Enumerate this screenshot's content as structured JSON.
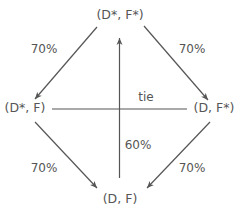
{
  "diagram": {
    "type": "state-transition",
    "colors": {
      "line": "#555555",
      "text": "#555555",
      "background": "#ffffff"
    },
    "nodes": {
      "top": {
        "label": "(D*, F*)"
      },
      "left": {
        "label": "(D*, F)"
      },
      "right": {
        "label": "(D, F*)"
      },
      "bottom": {
        "label": "(D, F)"
      }
    },
    "edges": {
      "top_to_left": {
        "from": "(D*, F*)",
        "to": "(D*, F)",
        "label": "70%",
        "directed": true
      },
      "top_to_right": {
        "from": "(D*, F*)",
        "to": "(D, F*)",
        "label": "70%",
        "directed": true
      },
      "left_to_bottom": {
        "from": "(D*, F)",
        "to": "(D, F)",
        "label": "70%",
        "directed": true
      },
      "right_to_bottom": {
        "from": "(D, F*)",
        "to": "(D, F)",
        "label": "70%",
        "directed": true
      },
      "bottom_to_top": {
        "from": "(D, F)",
        "to": "(D*, F*)",
        "label": "60%",
        "directed": true
      },
      "left_right": {
        "from": "(D*, F)",
        "to": "(D, F*)",
        "label": "tie",
        "directed": false
      }
    }
  }
}
